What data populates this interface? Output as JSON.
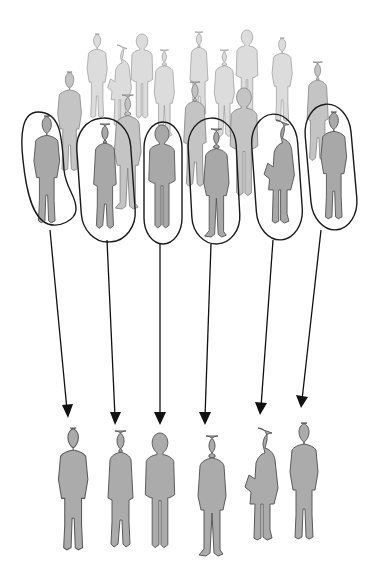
{
  "figure": {
    "title": "Sampling from a population",
    "colors": {
      "background": "#ffffff",
      "population_back": "#dcdcdc",
      "population_mid": "#c4c4c4",
      "selected": "#a8a8a8",
      "sample": "#ababab",
      "outline": "#1a1a1a"
    },
    "population": {
      "label": "population",
      "count_visible": 22
    },
    "selected": [
      {
        "id": 1,
        "cx": 45,
        "oval": [
          18,
          108,
          56,
          136
        ]
      },
      {
        "id": 2,
        "cx": 105,
        "oval": [
          78,
          118,
          54,
          128
        ]
      },
      {
        "id": 3,
        "cx": 162,
        "oval": [
          144,
          120,
          38,
          126
        ]
      },
      {
        "id": 4,
        "cx": 213,
        "oval": [
          190,
          118,
          48,
          128
        ]
      },
      {
        "id": 5,
        "cx": 273,
        "oval": [
          254,
          114,
          46,
          128
        ]
      },
      {
        "id": 6,
        "cx": 330,
        "oval": [
          308,
          104,
          46,
          126
        ]
      }
    ],
    "arrows": [
      {
        "from": [
          50,
          230
        ],
        "to": [
          68,
          418
        ]
      },
      {
        "from": [
          107,
          238
        ],
        "to": [
          115,
          425
        ]
      },
      {
        "from": [
          160,
          240
        ],
        "to": [
          160,
          425
        ]
      },
      {
        "from": [
          211,
          240
        ],
        "to": [
          205,
          425
        ]
      },
      {
        "from": [
          273,
          236
        ],
        "to": [
          261,
          415
        ]
      },
      {
        "from": [
          320,
          228
        ],
        "to": [
          302,
          408
        ]
      }
    ],
    "sample": {
      "label": "sample",
      "count": 6
    }
  }
}
